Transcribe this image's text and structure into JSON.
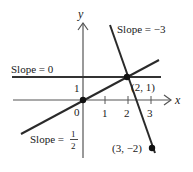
{
  "diagram": {
    "type": "coordinate-plane-lines",
    "axes": {
      "x_label": "x",
      "y_label": "y",
      "origin_label": "0",
      "x_ticks": [
        "1",
        "2",
        "3"
      ],
      "y_ticks": [
        "1"
      ]
    },
    "lines": [
      {
        "name": "horizontal",
        "label": "Slope = 0",
        "slope": 0,
        "through": [
          2,
          1
        ]
      },
      {
        "name": "rising",
        "label_prefix": "Slope = ",
        "label_num": "1",
        "label_den": "2",
        "slope": 0.5,
        "through": [
          0,
          0
        ]
      },
      {
        "name": "falling",
        "label": "Slope = −3",
        "slope": -3,
        "through": [
          2,
          1
        ]
      }
    ],
    "points": [
      {
        "name": "origin",
        "coords": [
          0,
          0
        ]
      },
      {
        "name": "intersection",
        "label": "(2, 1)",
        "coords": [
          2,
          1
        ]
      },
      {
        "name": "endpoint",
        "label": "(3, −2)",
        "coords": [
          3,
          -2
        ]
      }
    ],
    "colors": {
      "ink": "#1a1a1a",
      "axis": "#555555",
      "background": "#ffffff"
    }
  }
}
